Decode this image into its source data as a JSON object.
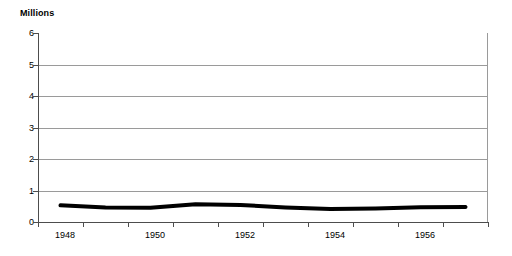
{
  "chart_data": {
    "type": "line",
    "title": "",
    "subtitle": "",
    "xlabel": "",
    "ylabel": "Millions",
    "ylim": [
      0,
      6
    ],
    "y_ticks": [
      0,
      1,
      2,
      3,
      4,
      5,
      6
    ],
    "y_tick_labels": [
      "0",
      "1",
      "2",
      "3",
      "4",
      "5",
      "6"
    ],
    "xlim": [
      1947.5,
      1957.5
    ],
    "x_tick_labels": [
      "1948",
      "1950",
      "1952",
      "1954",
      "1956"
    ],
    "x_tick_values": [
      1948,
      1950,
      1952,
      1954,
      1956
    ],
    "grid": true,
    "grid_axis": "y",
    "legend": false,
    "legend_position": "none",
    "annotations": [],
    "series": [
      {
        "name": "",
        "color": "#000000",
        "line_width": 4,
        "x": [
          1948,
          1949,
          1950,
          1951,
          1952,
          1953,
          1954,
          1955,
          1956,
          1957
        ],
        "values": [
          0.53,
          0.46,
          0.45,
          0.56,
          0.54,
          0.46,
          0.41,
          0.43,
          0.47,
          0.48
        ]
      }
    ]
  },
  "axes": {
    "y_title": "Millions",
    "y_tick_labels": [
      "6",
      "5",
      "4",
      "3",
      "2",
      "1",
      "0"
    ],
    "x_tick_labels": [
      "1948",
      "1950",
      "1952",
      "1954",
      "1956"
    ]
  },
  "colors": {
    "series_line": "#000000",
    "gridline": "#9a9a9a",
    "axis": "#4d4d4d",
    "background": "#ffffff",
    "text": "#000000"
  }
}
